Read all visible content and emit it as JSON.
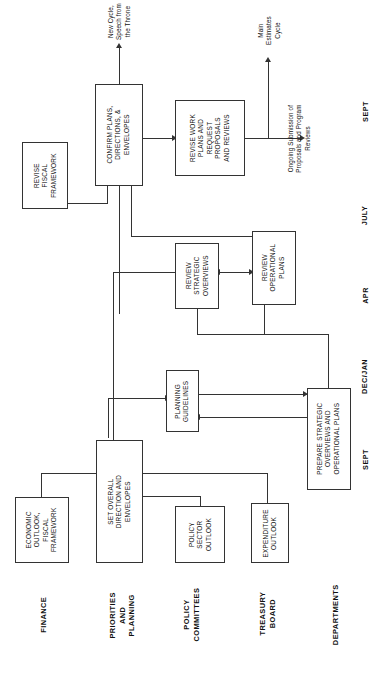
{
  "diagram": {
    "orientation": "rotated-90",
    "row_labels": [
      {
        "id": "finance",
        "text": "FINANCE"
      },
      {
        "id": "priorities-and-planning",
        "text": "PRIORITIES\nAND\nPLANNING"
      },
      {
        "id": "policy-committees",
        "text": "POLICY\nCOMMITTEES"
      },
      {
        "id": "treasury-board",
        "text": "TREASURY\nBOARD"
      },
      {
        "id": "departments",
        "text": "DEPARTMENTS"
      }
    ],
    "time_labels": [
      {
        "id": "sept-start",
        "text": "SEPT"
      },
      {
        "id": "dec-jan",
        "text": "DEC/JAN"
      },
      {
        "id": "apr",
        "text": "APR"
      },
      {
        "id": "july",
        "text": "JULY"
      },
      {
        "id": "sept-end",
        "text": "SEPT"
      }
    ],
    "boxes": [
      {
        "id": "economic-outlook",
        "text": "ECONOMIC\nOUTLOOK,\nFISCAL\nFRAMEWORK"
      },
      {
        "id": "set-overall-direction",
        "text": "SET OVERALL\nDIRECTION AND\nENVELOPES"
      },
      {
        "id": "policy-sector-outlook",
        "text": "POLICY\nSECTOR\nOUTLOOK"
      },
      {
        "id": "expenditure-outlook",
        "text": "EXPENDITURE\nOUTLOOK"
      },
      {
        "id": "prepare-strategic",
        "text": "PREPARE STRATEGIC\nOVERVIEWS AND\nOPERATIONAL PLANS"
      },
      {
        "id": "planning-guidelines",
        "text": "PLANNING\nGUIDELINES"
      },
      {
        "id": "review-strategic",
        "text": "REVIEW\nSTRATEGIC\nOVERVIEWS"
      },
      {
        "id": "review-operational",
        "text": "REVIEW\nOPERATIONAL\nPLANS"
      },
      {
        "id": "revise-fiscal-framework",
        "text": "REVISE\nFISCAL\nFRAMEWORK"
      },
      {
        "id": "confirm-plans",
        "text": "CONFIRM PLANS,\nDIRECTIONS, &\nENVELOPES"
      },
      {
        "id": "revise-work-plans",
        "text": "REVISE WORK\nPLANS AND\nREQUEST\nPROPOSALS\nAND REVIEWS"
      }
    ],
    "notes": [
      {
        "id": "new-cycle",
        "text": "New Cycle,\nSpeech from\nthe Throne"
      },
      {
        "id": "main-estimates",
        "text": "Main\nEstimates\nCycle"
      },
      {
        "id": "ongoing-submission",
        "text": "Ongoing Submission of\nProposals and Program\nReviews"
      }
    ],
    "colors": {
      "line": "#333333",
      "text": "#111111",
      "background": "#ffffff"
    }
  }
}
